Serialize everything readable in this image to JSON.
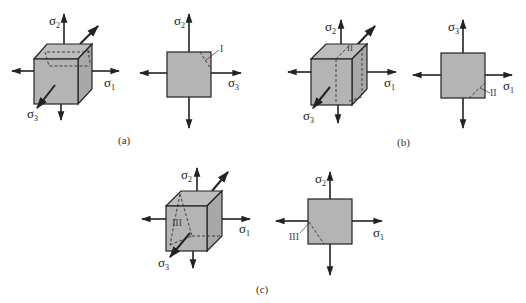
{
  "figure": {
    "colors": {
      "fill": "#b4b4b4",
      "fill_side": "#a6a6a6",
      "stroke": "#222222",
      "dashed": "#333333",
      "background": "#ffffff"
    }
  },
  "panels": [
    {
      "caption": "(a)",
      "cube": {
        "labels": {
          "s_up": "σ",
          "s_up_sub": "2",
          "s_right": "σ",
          "s_right_sub": "1",
          "s_diag": "σ",
          "s_diag_sub": "3"
        }
      },
      "square": {
        "labels": {
          "s_up": "σ",
          "s_up_sub": "2",
          "s_right": "σ",
          "s_right_sub": "3",
          "plane": "I"
        }
      }
    },
    {
      "caption": "(b)",
      "cube": {
        "labels": {
          "s_up": "σ",
          "s_up_sub": "2",
          "s_right": "σ",
          "s_right_sub": "1",
          "s_diag": "σ",
          "s_diag_sub": "3",
          "plane": "II"
        }
      },
      "square": {
        "labels": {
          "s_up": "σ",
          "s_up_sub": "3",
          "s_right": "σ",
          "s_right_sub": "1",
          "plane": "II"
        }
      }
    },
    {
      "caption": "(c)",
      "cube": {
        "labels": {
          "s_up": "σ",
          "s_up_sub": "2",
          "s_right": "σ",
          "s_right_sub": "1",
          "s_diag": "σ",
          "s_diag_sub": "3",
          "plane": "III"
        }
      },
      "square": {
        "labels": {
          "s_up": "σ",
          "s_up_sub": "2",
          "s_right": "σ",
          "s_right_sub": "1",
          "plane": "III"
        }
      }
    }
  ]
}
